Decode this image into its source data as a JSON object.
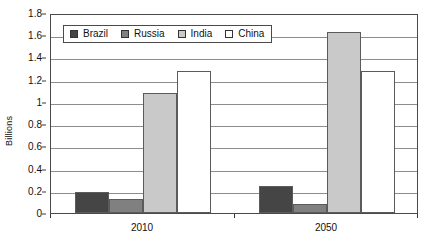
{
  "chart_data": {
    "type": "bar",
    "title": "",
    "subtitle": "",
    "xlabel": "",
    "ylabel": "Billions",
    "categories": [
      "2010",
      "2050"
    ],
    "ylim": [
      0,
      1.8
    ],
    "yticks": [
      0,
      0.2,
      0.4,
      0.6,
      0.8,
      1,
      1.2,
      1.4,
      1.6,
      1.8
    ],
    "ytick_labels": [
      "0",
      "0.2",
      "0.4",
      "0.6",
      "0.8",
      "1",
      "1.2",
      "1.4",
      "1.6",
      "1.8"
    ],
    "grid": "horizontal",
    "legend_position": "top-left-inside",
    "series": [
      {
        "name": "Brazil",
        "color": "#454545",
        "values": [
          0.19,
          0.24
        ]
      },
      {
        "name": "Russia",
        "color": "#808080",
        "values": [
          0.13,
          0.08
        ]
      },
      {
        "name": "India",
        "color": "#c9c9c9",
        "values": [
          1.08,
          1.63
        ]
      },
      {
        "name": "China",
        "color": "#ffffff",
        "values": [
          1.28,
          1.28
        ]
      }
    ]
  },
  "axis": {
    "y_title": "Billions"
  },
  "legend": {
    "entries": [
      {
        "label": "Brazil"
      },
      {
        "label": "Russia"
      },
      {
        "label": "India"
      },
      {
        "label": "China"
      }
    ]
  }
}
